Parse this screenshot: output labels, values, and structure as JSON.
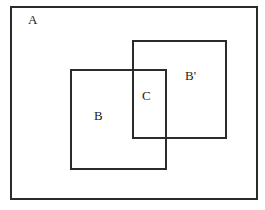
{
  "figure": {
    "background_color": "#ffffff",
    "stroke_color": "#2b2b2b"
  },
  "labels": {
    "universe": "A",
    "set_b": "B",
    "intersection": "C",
    "set_b_prime": "B'"
  },
  "shapes": {
    "universe_rect": {
      "name": "A",
      "x": 11,
      "y": 7,
      "width": 246,
      "height": 192
    },
    "b_rect": {
      "name": "B",
      "x": 71,
      "y": 70,
      "width": 95,
      "height": 99
    },
    "b_prime_rect": {
      "name": "B'",
      "x": 133,
      "y": 41,
      "width": 93,
      "height": 97
    },
    "c_region": {
      "name": "C",
      "x": 133,
      "y": 70,
      "width": 33,
      "height": 68
    }
  }
}
